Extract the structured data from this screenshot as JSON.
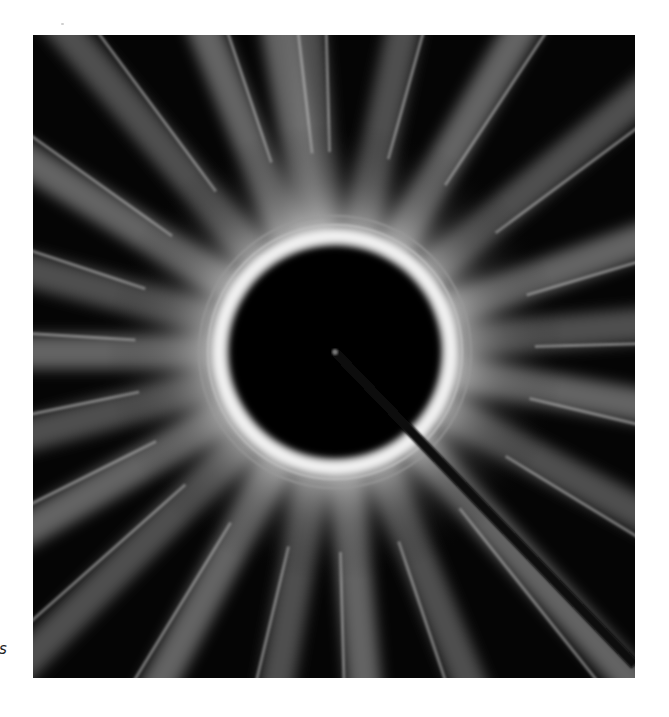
{
  "figure": {
    "margin_text_fragment": "s",
    "center": [
      302,
      317
    ],
    "inner_disk_radius": 105,
    "bright_ring_radius": 122,
    "outer_ring_radius": 136,
    "streak_angles_deg": [
      -100,
      -78,
      -60,
      -40,
      -20,
      -5,
      10,
      28,
      48,
      68,
      85,
      100,
      118,
      135,
      150,
      165,
      180,
      195,
      212,
      230,
      248,
      265
    ],
    "colors": {
      "background": "#050505",
      "ring": "#f2f2f2",
      "streak": "#9a9a9a",
      "page": "#ffffff"
    }
  }
}
